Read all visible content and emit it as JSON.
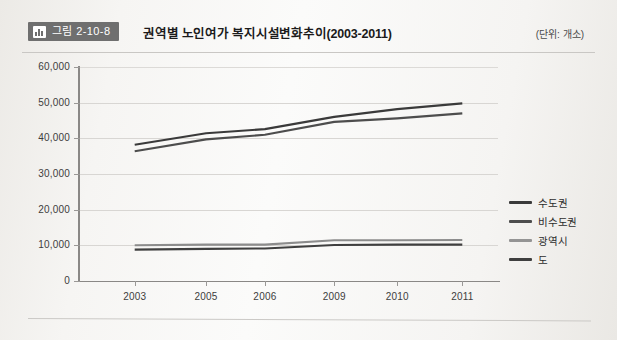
{
  "header": {
    "badge_icon": "bar-chart-icon",
    "badge_label": "그림 2-10-8",
    "title": "권역별 노인여가 복지시설변화추이(2003-2011)",
    "unit_note": "(단위: 개소)"
  },
  "chart_data": {
    "type": "line",
    "title": "권역별 노인여가 복지시설변화추이(2003-2011)",
    "xlabel": "",
    "ylabel": "",
    "unit": "개소",
    "categories": [
      "2003",
      "2005",
      "2006",
      "2009",
      "2010",
      "2011"
    ],
    "ylim": [
      0,
      60000
    ],
    "yticks": [
      0,
      10000,
      20000,
      30000,
      40000,
      50000,
      60000
    ],
    "ytick_labels": [
      "0",
      "10,000",
      "20,000",
      "30,000",
      "40,000",
      "50,000",
      "60,000"
    ],
    "grid": true,
    "legend_position": "right",
    "series": [
      {
        "name": "수도권",
        "color": "#3a3a3a",
        "values": [
          38200,
          41400,
          42600,
          46000,
          48200,
          49800
        ]
      },
      {
        "name": "비수도권",
        "color": "#4d4d4d",
        "values": [
          36400,
          39700,
          41000,
          44600,
          45600,
          47000
        ]
      },
      {
        "name": "광역시",
        "color": "#8c8c8c",
        "values": [
          10000,
          10200,
          10200,
          11400,
          11400,
          11500
        ]
      },
      {
        "name": "도",
        "color": "#3f3f3f",
        "values": [
          8800,
          9000,
          9100,
          10100,
          10200,
          10200
        ]
      }
    ]
  },
  "legend": [
    {
      "label": "수도권",
      "color": "#3a3a3a"
    },
    {
      "label": "비수도권",
      "color": "#4d4d4d"
    },
    {
      "label": "광역시",
      "color": "#949494"
    },
    {
      "label": "도",
      "color": "#3f3f3f"
    }
  ]
}
